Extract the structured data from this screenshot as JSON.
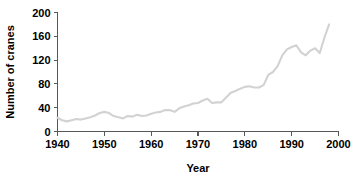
{
  "chart_data": {
    "type": "line",
    "title": "",
    "xlabel": "Year",
    "ylabel": "Number of cranes",
    "xlim": [
      1940,
      2000
    ],
    "ylim": [
      0,
      200
    ],
    "xticks": [
      1940,
      1950,
      1960,
      1970,
      1980,
      1990,
      2000
    ],
    "xtick_labels": [
      "1940",
      "1950",
      "1960",
      "1970",
      "1980",
      "1990",
      "2000"
    ],
    "yticks": [
      0,
      40,
      80,
      120,
      160,
      200
    ],
    "ytick_labels": [
      "0",
      "40",
      "80",
      "120",
      "160",
      "200"
    ],
    "grid": false,
    "legend": false,
    "line_color": "#d2d2d2",
    "axis_color": "#58585a",
    "series": [
      {
        "name": "Number of cranes",
        "x": [
          1940,
          1941,
          1942,
          1943,
          1944,
          1945,
          1946,
          1947,
          1948,
          1949,
          1950,
          1951,
          1952,
          1953,
          1954,
          1955,
          1956,
          1957,
          1958,
          1959,
          1960,
          1961,
          1962,
          1963,
          1964,
          1965,
          1966,
          1967,
          1968,
          1969,
          1970,
          1971,
          1972,
          1973,
          1974,
          1975,
          1976,
          1977,
          1978,
          1979,
          1980,
          1981,
          1982,
          1983,
          1984,
          1985,
          1986,
          1987,
          1988,
          1989,
          1990,
          1991,
          1992,
          1993,
          1994,
          1995,
          1996,
          1997,
          1998
        ],
        "values": [
          23,
          19,
          17,
          19,
          21,
          20,
          22,
          24,
          27,
          31,
          33,
          31,
          26,
          24,
          22,
          26,
          25,
          28,
          26,
          27,
          30,
          32,
          33,
          36,
          36,
          33,
          39,
          42,
          44,
          47,
          48,
          52,
          55,
          48,
          49,
          49,
          57,
          65,
          68,
          72,
          75,
          76,
          74,
          74,
          78,
          95,
          100,
          110,
          128,
          138,
          142,
          145,
          133,
          128,
          136,
          140,
          132,
          158,
          180
        ]
      }
    ]
  }
}
